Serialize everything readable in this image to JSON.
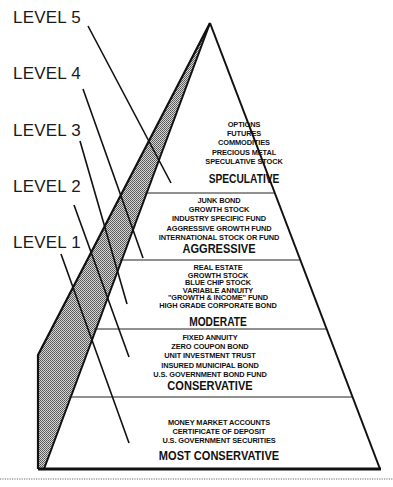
{
  "diagram": {
    "type": "investment-risk-pyramid",
    "levels": [
      {
        "label": "LEVEL 5",
        "tier": "SPECULATIVE"
      },
      {
        "label": "LEVEL 4",
        "tier": "AGGRESSIVE"
      },
      {
        "label": "LEVEL 3",
        "tier": "MODERATE"
      },
      {
        "label": "LEVEL 2",
        "tier": "CONSERVATIVE"
      },
      {
        "label": "LEVEL 1",
        "tier": "MOST CONSERVATIVE"
      }
    ],
    "tiers": {
      "speculative": {
        "title": "SPECULATIVE",
        "items": [
          "OPTIONS",
          "FUTURES",
          "COMMODITIES",
          "PRECIOUS METAL",
          "SPECULATIVE STOCK"
        ]
      },
      "aggressive": {
        "title": "AGGRESSIVE",
        "items": [
          "JUNK BOND",
          "GROWTH STOCK",
          "INDUSTRY SPECIFIC FUND",
          "AGGRESSIVE GROWTH FUND",
          "INTERNATIONAL STOCK OR FUND"
        ]
      },
      "moderate": {
        "title": "MODERATE",
        "items": [
          "REAL ESTATE",
          "GROWTH STOCK",
          "BLUE CHIP STOCK",
          "VARIABLE ANNUITY",
          "\"GROWTH & INCOME\" FUND",
          "HIGH GRADE CORPORATE BOND"
        ]
      },
      "conservative": {
        "title": "CONSERVATIVE",
        "items": [
          "FIXED ANNUITY",
          "ZERO COUPON BOND",
          "UNIT INVESTMENT TRUST",
          "INSURED MUNICIPAL BOND",
          "U.S. GOVERNMENT BOND FUND"
        ]
      },
      "most_conservative": {
        "title": "MOST CONSERVATIVE",
        "items": [
          "MONEY MARKET ACCOUNTS",
          "CERTIFICATE OF DEPOSIT",
          "U.S. GOVERNMENT SECURITIES"
        ]
      }
    },
    "colors": {
      "line": "#111111",
      "shade": "#9a9a9a",
      "background": "#ffffff"
    }
  }
}
